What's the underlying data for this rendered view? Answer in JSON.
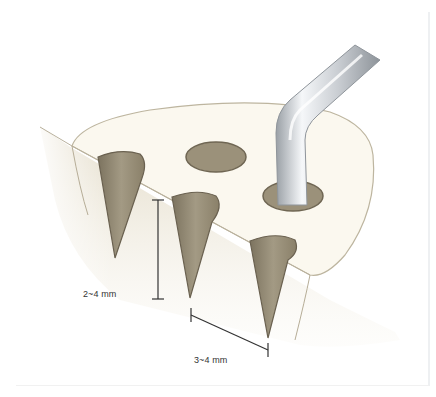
{
  "figure": {
    "title": "",
    "labels": {
      "depth": "2~4 mm",
      "spacing": "3~4 mm"
    },
    "colors": {
      "bone_surface": "#f8f5ea",
      "bone_side": "#e6dfcc",
      "hole_fill": "#9a8f78",
      "hole_edge": "#6d6452",
      "outline": "#b9b19d",
      "instrument_light": "#f4f6f8",
      "instrument_dark": "#a8adb3",
      "dimension_line": "#333333"
    }
  }
}
